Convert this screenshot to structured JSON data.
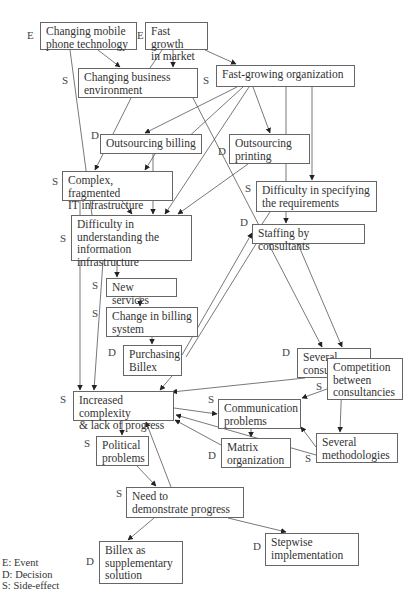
{
  "nodes": [
    {
      "id": "mobile",
      "label": "Changing mobile\nphone technology",
      "type": "E",
      "x": 40,
      "y": 22,
      "w": 97,
      "h": 28,
      "tx": 27,
      "ty": 35
    },
    {
      "id": "market",
      "label": "Fast growth\nin market",
      "type": "E",
      "x": 145,
      "y": 22,
      "w": 63,
      "h": 28,
      "tx": 137,
      "ty": 35
    },
    {
      "id": "business",
      "label": "Changing business\nenvironment",
      "type": "S",
      "x": 78,
      "y": 68,
      "w": 120,
      "h": 30,
      "tx": 62,
      "ty": 80
    },
    {
      "id": "fastorg",
      "label": "Fast-growing organization",
      "type": "S",
      "x": 216,
      "y": 65,
      "w": 139,
      "h": 22,
      "tx": 203,
      "ty": 80
    },
    {
      "id": "billing",
      "label": "Outsourcing billing",
      "type": "D",
      "x": 100,
      "y": 134,
      "w": 102,
      "h": 20,
      "tx": 91,
      "ty": 135
    },
    {
      "id": "printing",
      "label": "Outsourcing\nprinting",
      "type": "D",
      "x": 229,
      "y": 134,
      "w": 81,
      "h": 30,
      "tx": 218,
      "ty": 151
    },
    {
      "id": "complex",
      "label": "Complex, fragmented\nIT infrastructure",
      "type": "S",
      "x": 62,
      "y": 171,
      "w": 111,
      "h": 30,
      "tx": 52,
      "ty": 181
    },
    {
      "id": "specifying",
      "label": "Difficulty in specifying\nthe requirements",
      "type": "S",
      "x": 256,
      "y": 181,
      "w": 121,
      "h": 31,
      "tx": 245,
      "ty": 188
    },
    {
      "id": "understanding",
      "label": "Difficulty in\nunderstanding the\ninformation infrastructure",
      "type": "S",
      "x": 71,
      "y": 215,
      "w": 121,
      "h": 46,
      "tx": 60,
      "ty": 238
    },
    {
      "id": "staffing",
      "label": "Staffing by consultants",
      "type": "D",
      "x": 252,
      "y": 224,
      "w": 113,
      "h": 20,
      "tx": 240,
      "ty": 222
    },
    {
      "id": "newservices",
      "label": "New services",
      "type": "S",
      "x": 106,
      "y": 278,
      "w": 71,
      "h": 19,
      "tx": 92,
      "ty": 285
    },
    {
      "id": "changebilling",
      "label": "Change in billing\nsystem",
      "type": "S",
      "x": 106,
      "y": 307,
      "w": 92,
      "h": 30,
      "tx": 92,
      "ty": 313
    },
    {
      "id": "billex",
      "label": "Purchasing\nBillex",
      "type": "D",
      "x": 123,
      "y": 345,
      "w": 59,
      "h": 31,
      "tx": 108,
      "ty": 352
    },
    {
      "id": "consultancies",
      "label": "Several\nconsultancies",
      "type": "D",
      "x": 297,
      "y": 348,
      "w": 74,
      "h": 30,
      "tx": 282,
      "ty": 352,
      "dx": -98
    },
    {
      "id": "competition",
      "label": "Competition\nbetween\nconsultancies",
      "type": "S",
      "x": 327,
      "y": 358,
      "w": 76,
      "h": 42,
      "tx": 316,
      "ty": 386,
      "dx": 0
    },
    {
      "id": "increased",
      "label": "Increased complexity\n& lack of progress",
      "type": "S",
      "x": 73,
      "y": 391,
      "w": 101,
      "h": 30,
      "tx": 60,
      "ty": 399
    },
    {
      "id": "communication",
      "label": "Communication\nproblems",
      "type": "S",
      "x": 218,
      "y": 399,
      "w": 83,
      "h": 30,
      "tx": 208,
      "ty": 399
    },
    {
      "id": "matrix",
      "label": "Matrix\norganization",
      "type": "D",
      "x": 221,
      "y": 438,
      "w": 70,
      "h": 30,
      "tx": 208,
      "ty": 455
    },
    {
      "id": "methodologies",
      "label": "Several\nmethodologies",
      "type": "S",
      "x": 316,
      "y": 433,
      "w": 82,
      "h": 30,
      "tx": 305,
      "ty": 458
    },
    {
      "id": "political",
      "label": "Political\nproblems",
      "type": "S",
      "x": 96,
      "y": 436,
      "w": 53,
      "h": 30,
      "tx": 84,
      "ty": 443
    },
    {
      "id": "demonstrate",
      "label": "Need to\ndemonstrate progress",
      "type": "S",
      "x": 126,
      "y": 487,
      "w": 118,
      "h": 31,
      "tx": 116,
      "ty": 493
    },
    {
      "id": "supplementary",
      "label": "Billex as\nsupplementary\nsolution",
      "type": "D",
      "x": 99,
      "y": 541,
      "w": 84,
      "h": 43,
      "tx": 86,
      "ty": 561
    },
    {
      "id": "stepwise",
      "label": "Stepwise\nimplementation",
      "type": "D",
      "x": 265,
      "y": 533,
      "w": 94,
      "h": 33,
      "tx": 253,
      "ty": 546
    }
  ],
  "legend": {
    "items": [
      "E: Event",
      "D: Decision",
      "S: Side-effect"
    ]
  }
}
